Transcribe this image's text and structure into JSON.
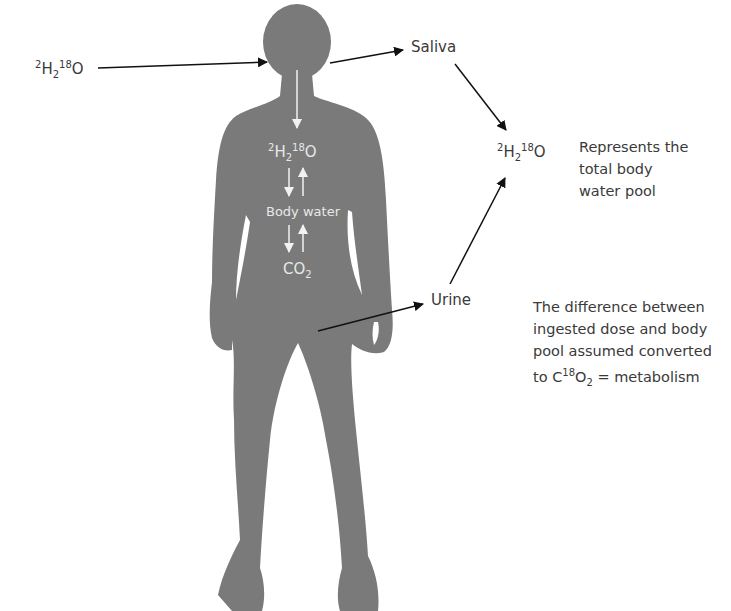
{
  "diagram": {
    "type": "doubly-labelled water method",
    "silhouette_color": "#7a7a7a",
    "arrow_color": "#111111",
    "inner_arrow_color": "#f2f2f2",
    "dose": {
      "iso_h": "2",
      "h": "H",
      "sub": "2",
      "iso_o": "18",
      "o": "O"
    },
    "saliva_label": "Saliva",
    "urine_label": "Urine",
    "pool": {
      "iso_h": "2",
      "h": "H",
      "sub": "2",
      "iso_o": "18",
      "o": "O"
    },
    "pool_note": [
      "Represents the",
      "total body",
      "water pool"
    ],
    "body": {
      "tracer": {
        "iso_h": "2",
        "h": "H",
        "sub": "2",
        "iso_o": "18",
        "o": "O"
      },
      "body_water_label": "Body water",
      "co2": {
        "c": "CO",
        "sub": "2"
      }
    },
    "metabolism_note": {
      "lines": [
        "The difference between",
        "ingested dose and body",
        "pool assumed converted"
      ],
      "last_prefix": "to C",
      "last_sup": "18",
      "last_o": "O",
      "last_sub": "2",
      "last_suffix": " = metabolism"
    }
  }
}
